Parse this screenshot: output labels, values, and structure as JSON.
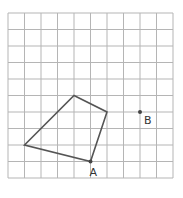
{
  "grid": {
    "origin_x": 8,
    "origin_y": 13,
    "cell_size": 16.5,
    "columns": 10,
    "rows": 10,
    "line_color": "#b5b5b5"
  },
  "shape": {
    "type": "quadrilateral",
    "stroke_color": "#555555",
    "vertices_grid": [
      [
        4,
        5
      ],
      [
        6,
        6
      ],
      [
        5,
        9
      ],
      [
        1,
        8
      ]
    ]
  },
  "points": [
    {
      "name": "A",
      "label": "A",
      "grid": [
        5,
        9
      ]
    },
    {
      "name": "B",
      "label": "B",
      "grid": [
        8,
        6
      ]
    }
  ],
  "labels": {
    "A": "A",
    "B": "B"
  }
}
